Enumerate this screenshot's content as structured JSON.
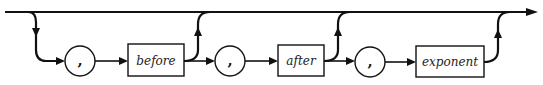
{
  "diagram": {
    "type": "syntax-railroad",
    "nodes": [
      {
        "kind": "terminal",
        "text": ","
      },
      {
        "kind": "nonterminal",
        "text": "before"
      },
      {
        "kind": "terminal",
        "text": ","
      },
      {
        "kind": "nonterminal",
        "text": "after"
      },
      {
        "kind": "terminal",
        "text": ","
      },
      {
        "kind": "nonterminal",
        "text": "exponent"
      }
    ],
    "bypass": "top line allows skipping; exits after each nonterminal rejoin the top line"
  }
}
